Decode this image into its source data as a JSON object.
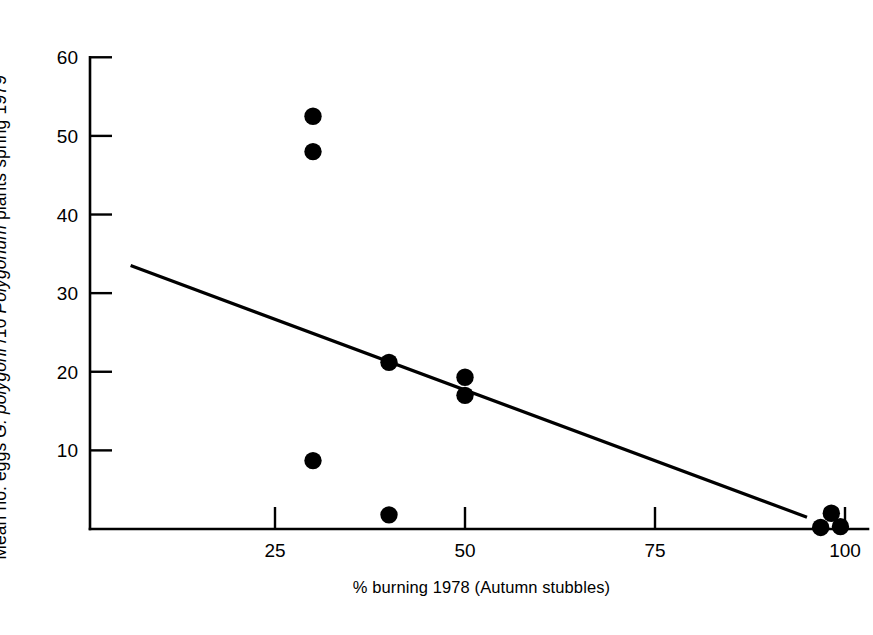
{
  "chart_data": {
    "type": "scatter",
    "title": "",
    "xlabel": "% burning 1978 (Autumn stubbles)",
    "ylabel_parts": [
      {
        "text": "Mean no. eggs ",
        "italic": false
      },
      {
        "text": "G. polygoni",
        "italic": true
      },
      {
        "text": " /10 ",
        "italic": false
      },
      {
        "text": "Polygonum",
        "italic": true
      },
      {
        "text": " plants spring 1979",
        "italic": false
      }
    ],
    "ylabel": "Mean no. eggs G. polygoni /10 Polygonum plants spring 1979",
    "xlim": [
      0,
      105
    ],
    "ylim": [
      0,
      60
    ],
    "xticks": [
      25,
      50,
      75,
      100
    ],
    "xtick_labels": [
      "25",
      "50",
      "75",
      "100"
    ],
    "yticks": [
      10,
      20,
      30,
      40,
      50,
      60
    ],
    "ytick_labels": [
      "10",
      "20",
      "30",
      "40",
      "50",
      "60"
    ],
    "grid": false,
    "legend": null,
    "marker": {
      "shape": "circle",
      "color": "#000000",
      "size": 11
    },
    "points": [
      {
        "x": 30,
        "y": 52.5
      },
      {
        "x": 30,
        "y": 48.0
      },
      {
        "x": 30,
        "y": 8.7
      },
      {
        "x": 40,
        "y": 21.2
      },
      {
        "x": 40,
        "y": 1.8
      },
      {
        "x": 50,
        "y": 19.3
      },
      {
        "x": 50,
        "y": 17.0
      },
      {
        "x": 98.2,
        "y": 2.0
      },
      {
        "x": 96.8,
        "y": 0.2
      },
      {
        "x": 99.4,
        "y": 0.3
      }
    ],
    "series": [
      {
        "name": "observations",
        "x": [
          30,
          30,
          30,
          40,
          40,
          50,
          50,
          98.2,
          96.8,
          99.4
        ],
        "y": [
          52.5,
          48.0,
          8.7,
          21.2,
          1.8,
          19.3,
          17.0,
          2.0,
          0.2,
          0.3
        ]
      }
    ],
    "fit_line": {
      "type": "linear-regression",
      "x_start": 6.0,
      "y_start": 33.5,
      "x_end": 95.0,
      "y_end": 1.5,
      "color": "#000000"
    }
  },
  "axes": {
    "y_axis_name": "y-axis",
    "x_axis_name": "x-axis"
  }
}
